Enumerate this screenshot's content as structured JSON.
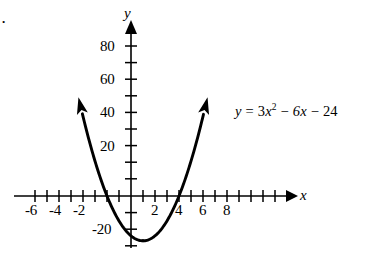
{
  "figure": {
    "problem_mark": ".",
    "background_color": "#ffffff",
    "curve_color": "#000000",
    "axis_color": "#000000"
  },
  "axes": {
    "x_name": "x",
    "y_name": "y",
    "x_tick_labels": [
      "-6",
      "-4",
      "-2",
      "2",
      "4",
      "6",
      "8"
    ],
    "y_tick_labels": [
      "80",
      "60",
      "40",
      "20",
      "-20"
    ]
  },
  "equation": {
    "lhs": "y",
    "equals": "=",
    "term1_coeff": "3",
    "term1_var": "x",
    "term1_exp": "2",
    "minus1": "−",
    "term2": "6x",
    "minus2": "−",
    "term3": "24",
    "full_text": "y = 3x² − 6x − 24"
  },
  "chart_data": {
    "type": "line",
    "title": "",
    "subtitle": "",
    "xlabel": "x",
    "ylabel": "y",
    "xlim": [
      -7.5,
      9.5
    ],
    "ylim": [
      -32,
      92
    ],
    "xticks": [
      -7,
      -6,
      -5,
      -4,
      -3,
      -2,
      -1,
      1,
      2,
      3,
      4,
      5,
      6,
      7,
      8
    ],
    "xticks_labeled": [
      -6,
      -4,
      -2,
      2,
      4,
      6,
      8
    ],
    "yticks": [
      -30,
      -20,
      -10,
      10,
      20,
      30,
      40,
      50,
      60,
      70,
      80
    ],
    "yticks_labeled": [
      20,
      40,
      60,
      80,
      -20
    ],
    "grid": false,
    "legend": null,
    "annotations": [
      "y = 3x² − 6x − 24"
    ],
    "series": [
      {
        "name": "y = 3x^2 - 6x - 24",
        "equation": "y = 3*x^2 - 6*x - 24",
        "a": 3,
        "b": -6,
        "c": -24,
        "vertex": [
          1,
          -27
        ],
        "roots": [
          -2,
          4
        ],
        "y_intercept": -24,
        "arrowheads": [
          "left-branch-up",
          "right-branch-up"
        ],
        "x": [
          -4.1,
          -3.5,
          -3,
          -2.5,
          -2,
          -1.5,
          -1,
          -0.5,
          0,
          0.5,
          1,
          1.5,
          2,
          2.5,
          3,
          3.5,
          4,
          4.5,
          5,
          5.5,
          6.1
        ],
        "y": [
          32.4,
          33.8,
          21,
          9.8,
          0,
          -8.3,
          -15,
          -20.3,
          -24,
          -26.3,
          -27,
          -26.3,
          -24,
          -20.3,
          -15,
          -8.3,
          0,
          9.8,
          21,
          33.8,
          54.7
        ]
      }
    ]
  }
}
